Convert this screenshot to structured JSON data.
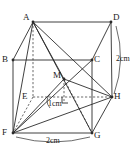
{
  "figure": {
    "type": "3d-geometry-diagram",
    "shape_name": "cuboid",
    "stroke_color": "#2b2b2b",
    "background_color": "#ffffff"
  },
  "vertices": [
    {
      "key": "A",
      "label": "A",
      "x": 33,
      "y": 22,
      "hidden": false,
      "label_dx": -10,
      "label_dy": -9
    },
    {
      "key": "B",
      "label": "B",
      "x": 13,
      "y": 60,
      "hidden": false,
      "label_dx": -11,
      "label_dy": -5
    },
    {
      "key": "C",
      "label": "C",
      "x": 92,
      "y": 60,
      "hidden": false,
      "label_dx": 2,
      "label_dy": -5
    },
    {
      "key": "D",
      "label": "D",
      "x": 111,
      "y": 22,
      "hidden": false,
      "label_dx": 2,
      "label_dy": -9
    },
    {
      "key": "E",
      "label": "E",
      "x": 33,
      "y": 97,
      "hidden": true,
      "label_dx": -11,
      "label_dy": -5
    },
    {
      "key": "F",
      "label": "F",
      "x": 13,
      "y": 133,
      "hidden": false,
      "label_dx": -11,
      "label_dy": -5
    },
    {
      "key": "G",
      "label": "G",
      "x": 92,
      "y": 133,
      "hidden": false,
      "label_dx": 2,
      "label_dy": -2
    },
    {
      "key": "H",
      "label": "H",
      "x": 112,
      "y": 97,
      "hidden": false,
      "label_dx": 2,
      "label_dy": -5
    },
    {
      "key": "M",
      "label": "M",
      "x": 64,
      "y": 79,
      "hidden": false,
      "label_dx": -11,
      "label_dy": -8
    }
  ],
  "edges": [
    {
      "from": "A",
      "to": "D",
      "hidden": false
    },
    {
      "from": "A",
      "to": "B",
      "hidden": false
    },
    {
      "from": "D",
      "to": "C",
      "hidden": false
    },
    {
      "from": "B",
      "to": "C",
      "hidden": false
    },
    {
      "from": "B",
      "to": "F",
      "hidden": false
    },
    {
      "from": "C",
      "to": "G",
      "hidden": false
    },
    {
      "from": "D",
      "to": "H",
      "hidden": false
    },
    {
      "from": "F",
      "to": "G",
      "hidden": false
    },
    {
      "from": "G",
      "to": "H",
      "hidden": false
    },
    {
      "from": "A",
      "to": "E",
      "hidden": true
    },
    {
      "from": "E",
      "to": "F",
      "hidden": true
    },
    {
      "from": "E",
      "to": "H",
      "hidden": true
    }
  ],
  "apex_lines": [
    {
      "from": "A",
      "to": "F",
      "hidden": false
    },
    {
      "from": "A",
      "to": "G",
      "hidden": false
    },
    {
      "from": "A",
      "to": "H",
      "hidden": false
    },
    {
      "from": "A",
      "to": "M",
      "hidden": false
    },
    {
      "from": "F",
      "to": "H",
      "hidden": false
    },
    {
      "from": "F",
      "to": "M",
      "hidden": false
    },
    {
      "from": "M",
      "to": "H",
      "hidden": false
    },
    {
      "from": "M",
      "to": "G",
      "hidden": true
    },
    {
      "from": "F",
      "to": "C",
      "hidden": false
    }
  ],
  "foot": {
    "x": 64,
    "y": 101,
    "from": "M",
    "hidden": true
  },
  "right_angle_marker": {
    "x": 62,
    "y": 103,
    "size": 6
  },
  "dimensions": [
    {
      "key": "height",
      "text": "2cm",
      "x": 116,
      "y": 55,
      "orientation": "vertical",
      "measures": "D-H"
    },
    {
      "key": "m-drop",
      "text": "1cm",
      "x": 48,
      "y": 100,
      "orientation": "vertical",
      "measures": "M-foot"
    },
    {
      "key": "base",
      "text": "2cm",
      "x": 46,
      "y": 137,
      "orientation": "horizontal",
      "measures": "F-G"
    }
  ],
  "measure_arcs": [
    {
      "key": "right-arc",
      "d": "M 116 26 Q 126 60 114 94"
    },
    {
      "key": "bottom-arc",
      "d": "M 16 137 Q 53 147 90 137"
    },
    {
      "key": "m-arc",
      "d": "M 50 94 Q 44 101 50 108"
    }
  ]
}
